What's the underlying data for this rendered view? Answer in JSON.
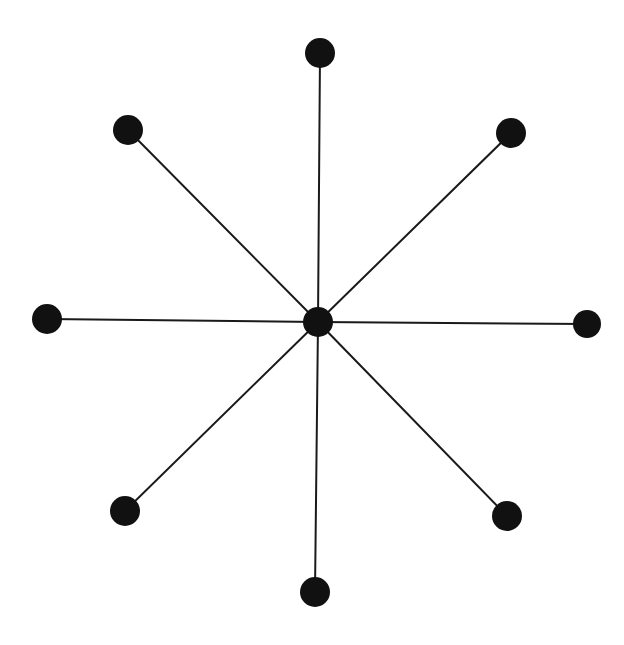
{
  "diagram": {
    "type": "star-graph",
    "canvas": {
      "width": 624,
      "height": 645,
      "background": "#ffffff"
    },
    "style": {
      "node_color": "#111111",
      "edge_color": "#1a1a1a",
      "edge_width": 2
    },
    "hub": {
      "id": "center",
      "x": 318,
      "y": 322,
      "r": 15
    },
    "leaves": [
      {
        "id": "top",
        "x": 320,
        "y": 53,
        "r": 15
      },
      {
        "id": "top-right",
        "x": 511,
        "y": 133,
        "r": 15
      },
      {
        "id": "right",
        "x": 587,
        "y": 324,
        "r": 14
      },
      {
        "id": "bottom-right",
        "x": 507,
        "y": 516,
        "r": 15
      },
      {
        "id": "bottom",
        "x": 315,
        "y": 592,
        "r": 15
      },
      {
        "id": "bottom-left",
        "x": 125,
        "y": 511,
        "r": 15
      },
      {
        "id": "left",
        "x": 47,
        "y": 319,
        "r": 15
      },
      {
        "id": "top-left",
        "x": 128,
        "y": 130,
        "r": 15
      }
    ],
    "edges": [
      [
        "center",
        "top"
      ],
      [
        "center",
        "top-right"
      ],
      [
        "center",
        "right"
      ],
      [
        "center",
        "bottom-right"
      ],
      [
        "center",
        "bottom"
      ],
      [
        "center",
        "bottom-left"
      ],
      [
        "center",
        "left"
      ],
      [
        "center",
        "top-left"
      ]
    ]
  }
}
